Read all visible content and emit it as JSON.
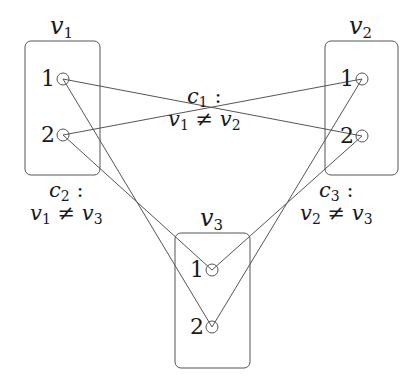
{
  "diagram": {
    "type": "constraint-graph",
    "colors": {
      "stroke": "#555555",
      "text": "#1a1a1a",
      "background": "#ffffff"
    },
    "variables": [
      {
        "id": "v1",
        "name": "v",
        "sub": "1",
        "box": {
          "x": 25,
          "y": 41,
          "w": 75,
          "h": 134
        },
        "label_pos": {
          "x": 50,
          "y": 14
        },
        "values": [
          {
            "label": "1",
            "cx": 63,
            "cy": 79
          },
          {
            "label": "2",
            "cx": 63,
            "cy": 135
          }
        ]
      },
      {
        "id": "v2",
        "name": "v",
        "sub": "2",
        "box": {
          "x": 325,
          "y": 41,
          "w": 73,
          "h": 134
        },
        "label_pos": {
          "x": 349,
          "y": 14
        },
        "values": [
          {
            "label": "1",
            "cx": 362,
            "cy": 79
          },
          {
            "label": "2",
            "cx": 362,
            "cy": 136
          }
        ]
      },
      {
        "id": "v3",
        "name": "v",
        "sub": "3",
        "box": {
          "x": 175,
          "y": 233,
          "w": 75,
          "h": 135
        },
        "label_pos": {
          "x": 200,
          "y": 206
        },
        "values": [
          {
            "label": "1",
            "cx": 212,
            "cy": 270
          },
          {
            "label": "2",
            "cx": 212,
            "cy": 327
          }
        ]
      }
    ],
    "constraints": [
      {
        "id": "c1",
        "name": "c",
        "sub": "1",
        "lhs": "v",
        "lhs_sub": "1",
        "op": "≠",
        "rhs": "v",
        "rhs_sub": "2",
        "pos": {
          "x": 168,
          "y": 86
        },
        "edges": [
          [
            "v1.1",
            "v2.2"
          ],
          [
            "v1.2",
            "v2.1"
          ]
        ]
      },
      {
        "id": "c2",
        "name": "c",
        "sub": "2",
        "lhs": "v",
        "lhs_sub": "1",
        "op": "≠",
        "rhs": "v",
        "rhs_sub": "3",
        "pos": {
          "x": 30,
          "y": 180
        },
        "edges": [
          [
            "v1.1",
            "v3.2"
          ],
          [
            "v1.2",
            "v3.1"
          ]
        ]
      },
      {
        "id": "c3",
        "name": "c",
        "sub": "3",
        "lhs": "v",
        "lhs_sub": "2",
        "op": "≠",
        "rhs": "v",
        "rhs_sub": "3",
        "pos": {
          "x": 300,
          "y": 180
        },
        "edges": [
          [
            "v2.1",
            "v3.2"
          ],
          [
            "v2.2",
            "v3.1"
          ]
        ]
      }
    ]
  }
}
